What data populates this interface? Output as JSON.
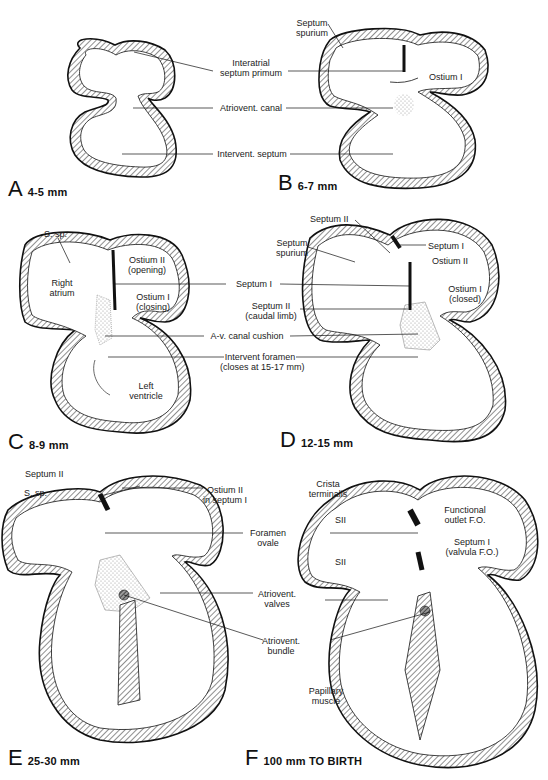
{
  "figure": {
    "panels": [
      {
        "id": "A",
        "stage": "4-5 mm"
      },
      {
        "id": "B",
        "stage": "6-7 mm"
      },
      {
        "id": "C",
        "stage": "8-9 mm"
      },
      {
        "id": "D",
        "stage": "12-15 mm"
      },
      {
        "id": "E",
        "stage": "25-30 mm"
      },
      {
        "id": "F",
        "stage": "100 mm  TO BIRTH"
      }
    ]
  },
  "labels": {
    "row1": {
      "interatrial_septum_primum_1": "Interatrial",
      "interatrial_septum_primum_2": "septum primum",
      "atriovent_canal": "Atriovent. canal",
      "intervent_septum": "Intervent. septum",
      "septum_spurium_1": "Septum",
      "septum_spurium_2": "spurium",
      "ostium_1": "Ostium I"
    },
    "row2": {
      "s_sp": "S. sp.",
      "right_atrium_1": "Right",
      "right_atrium_2": "atrium",
      "ostium_2_opening_1": "Ostium II",
      "ostium_2_opening_2": "(opening)",
      "ostium_1_closing_1": "Ostium I",
      "ostium_1_closing_2": "(closing)",
      "left_ventricle_1": "Left",
      "left_ventricle_2": "ventricle",
      "septum_1": "Septum I",
      "septum_2_caudal_1": "Septum II",
      "septum_2_caudal_2": "(caudal limb)",
      "av_canal_cushion": "A-v. canal cushion",
      "intervent_foramen_1": "Intervent foramen",
      "intervent_foramen_2": "(closes at 15-17  mm)",
      "d_septum_2": "Septum II",
      "d_septum_spurium_1": "Septum",
      "d_septum_spurium_2": "spurium",
      "d_septum_1": "Septum I",
      "d_ostium_2": "Ostium II",
      "d_ostium_1_closed_1": "Ostium I",
      "d_ostium_1_closed_2": "(closed)"
    },
    "row3": {
      "e_septum_2": "Septum II",
      "e_s_sp": "S. sp.",
      "e_ostium_2_1": "Ostium II",
      "e_ostium_2_2": "in septum I",
      "foramen_ovale_1": "Foramen",
      "foramen_ovale_2": "ovale",
      "atriovent_valves_1": "Atriovent.",
      "atriovent_valves_2": "valves",
      "atriovent_bundle_1": "Atriovent.",
      "atriovent_bundle_2": "bundle",
      "crista_terminalis_1": "Crista",
      "crista_terminalis_2": "terminalis",
      "functional_outlet_1": "Functional",
      "functional_outlet_2": "outlet F.O.",
      "sii_upper": "SII",
      "sii_lower": "SII",
      "septum_1_valvula_1": "Septum I",
      "septum_1_valvula_2": "(valvula F.O.)",
      "papillary_muscle_1": "Papillary",
      "papillary_muscle_2": "muscle"
    }
  },
  "colors": {
    "ink": "#1a1a1a",
    "hatch": "#555555",
    "cushion_stipple": "#bbbbbb",
    "background": "#ffffff"
  }
}
